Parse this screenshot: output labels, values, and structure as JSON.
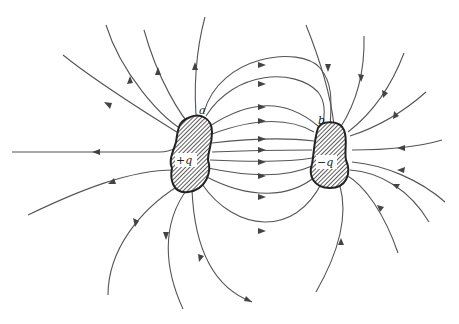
{
  "figure": {
    "conductor_a": {
      "point_label": "a",
      "charge_label": "+q"
    },
    "conductor_b": {
      "point_label": "b",
      "charge_label": "−q"
    },
    "colors": {
      "line": "#555555",
      "body_fill": "#9a9a9a",
      "outline": "#222222",
      "background": "#ffffff"
    }
  }
}
